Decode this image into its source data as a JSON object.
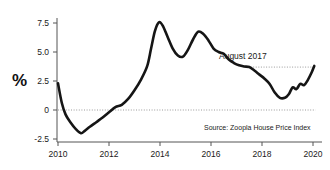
{
  "chart_data": {
    "type": "line",
    "title": "",
    "subtitle": "",
    "xlabel": "",
    "ylabel": "%",
    "xlim": [
      2010.0,
      2020.1
    ],
    "ylim": [
      -3.1,
      8.6
    ],
    "grid": false,
    "legend": "none",
    "x_ticks": [
      2010,
      2012,
      2014,
      2016,
      2018,
      2020
    ],
    "x_tick_labels": [
      "2010",
      "2012",
      "2014",
      "2016",
      "2018",
      "2020"
    ],
    "y_ticks": [
      -2.5,
      0,
      2.5,
      5.0,
      7.5
    ],
    "y_tick_labels": [
      "-2.5",
      "0",
      "2.5",
      "5.0",
      "7.5"
    ],
    "series": [
      {
        "name": "Zoopla House Price Index annual growth",
        "color": "#151515",
        "x": [
          2010.0,
          2010.15,
          2010.3,
          2010.5,
          2010.7,
          2010.9,
          2011.05,
          2011.25,
          2011.5,
          2011.75,
          2012.0,
          2012.25,
          2012.5,
          2012.75,
          2013.0,
          2013.25,
          2013.5,
          2013.65,
          2013.8,
          2013.95,
          2014.1,
          2014.3,
          2014.5,
          2014.7,
          2014.9,
          2015.1,
          2015.3,
          2015.5,
          2015.7,
          2015.9,
          2016.1,
          2016.3,
          2016.5,
          2016.7,
          2016.9,
          2017.1,
          2017.3,
          2017.5,
          2017.7,
          2017.9,
          2018.1,
          2018.3,
          2018.5,
          2018.7,
          2018.9,
          2019.05,
          2019.2,
          2019.35,
          2019.5,
          2019.65,
          2019.8,
          2019.95,
          2020.05
        ],
        "y": [
          2.3,
          0.6,
          -0.4,
          -1.1,
          -1.65,
          -2.0,
          -1.8,
          -1.45,
          -1.05,
          -0.65,
          -0.2,
          0.25,
          0.45,
          0.95,
          1.7,
          2.6,
          3.8,
          5.3,
          6.8,
          7.55,
          7.3,
          6.3,
          5.3,
          4.7,
          4.6,
          5.2,
          6.1,
          6.75,
          6.55,
          6.0,
          5.3,
          5.0,
          4.85,
          4.35,
          4.05,
          3.85,
          3.75,
          3.7,
          3.4,
          3.05,
          2.7,
          2.25,
          1.5,
          1.05,
          1.05,
          1.35,
          1.95,
          1.8,
          2.25,
          2.15,
          2.6,
          3.25,
          3.8
        ]
      }
    ],
    "reference_lines": [
      {
        "name": "zero-line",
        "value": 0,
        "style": "dotted",
        "x_start": 2010.0,
        "x_end": 2020.1
      },
      {
        "name": "august-2017-level",
        "value": 3.7,
        "style": "dotted",
        "x_start": 2017.55,
        "x_end": 2020.0
      }
    ],
    "annotations": [
      {
        "name": "august-2017-annotation",
        "text": "August 2017",
        "x": 2017.6,
        "y": 4.6
      },
      {
        "name": "source-annotation",
        "text": "Source: Zoopla House Price Index",
        "x": 2017.0,
        "y": -1.45
      }
    ]
  },
  "axis": {
    "y_label": "%"
  },
  "annotations": {
    "august_2017": "August 2017",
    "source": "Source: Zoopla House Price Index"
  },
  "colors": {
    "line": "#151515",
    "axis": "#555555",
    "dotted": "#9a9a9a",
    "background": "#ffffff",
    "text": "#1a1a1a"
  }
}
